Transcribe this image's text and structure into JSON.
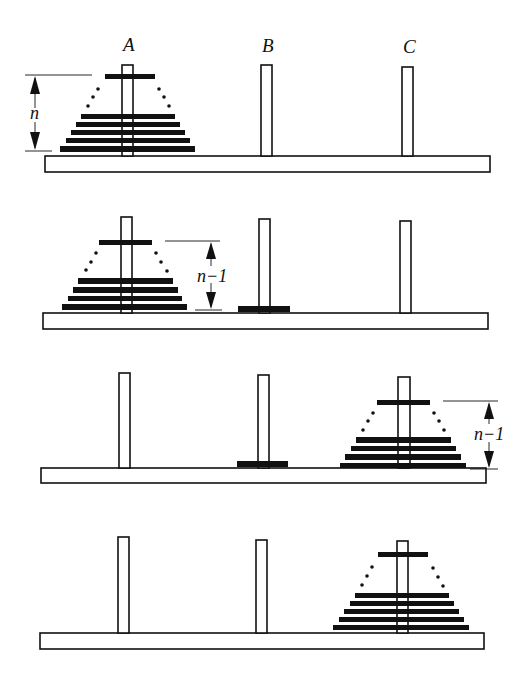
{
  "peg_labels": [
    "A",
    "B",
    "C"
  ],
  "panels": [
    {
      "step": 1,
      "description": "n disks on peg A",
      "height_label": "n"
    },
    {
      "step": 2,
      "description": "n-1 disks remain on A after moving largest to B? (top n-1 stack on A, largest on B)",
      "height_label": "n−1"
    },
    {
      "step": 3,
      "description": "n-1 disks moved to C, largest disk on B",
      "height_label": "n−1"
    },
    {
      "step": 4,
      "description": "all n disks on peg C",
      "height_label": ""
    }
  ],
  "colors": {
    "ink": "#111111",
    "background": "#ffffff"
  }
}
